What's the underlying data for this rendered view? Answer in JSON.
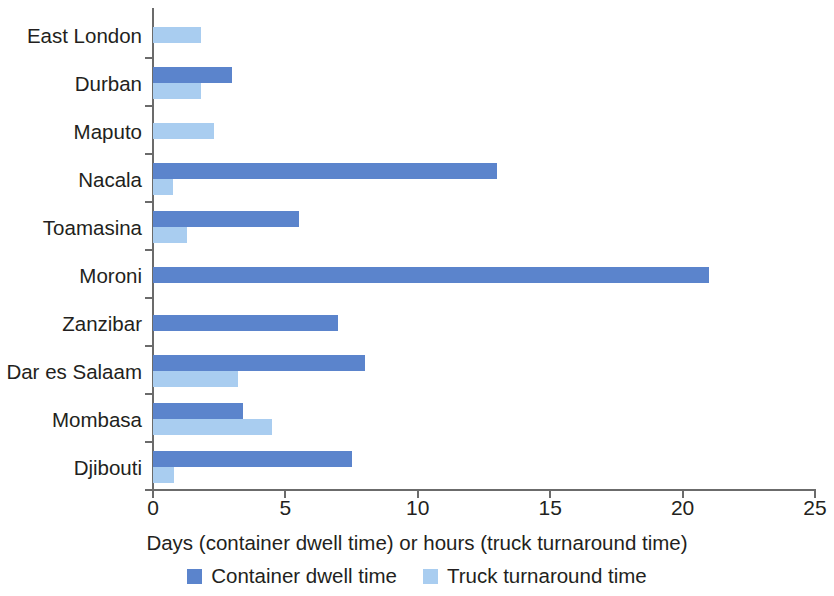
{
  "chart_data": {
    "type": "bar",
    "orientation": "horizontal",
    "title": "",
    "subtitle": "",
    "xlabel": "Days (container dwell time) or hours (truck turnaround time)",
    "ylabel": "",
    "xlim": [
      0,
      25
    ],
    "xticks": [
      0,
      5,
      10,
      15,
      20,
      25
    ],
    "xtick_labels": [
      "0",
      "5",
      "10",
      "15",
      "20",
      "25"
    ],
    "grid": false,
    "legend_position": "bottom-center",
    "categories": [
      "East London",
      "Durban",
      "Maputo",
      "Nacala",
      "Toamasina",
      "Moroni",
      "Zanzibar",
      "Dar es Salaam",
      "Mombasa",
      "Djibouti"
    ],
    "series": [
      {
        "name": "Container dwell time",
        "color": "#5b84cc",
        "unit": "days",
        "values": [
          null,
          3.0,
          null,
          13.0,
          5.5,
          21.0,
          7.0,
          8.0,
          3.4,
          7.5
        ]
      },
      {
        "name": "Truck turnaround time",
        "color": "#a9cdf0",
        "unit": "hours",
        "values": [
          1.8,
          1.8,
          2.3,
          0.75,
          1.3,
          null,
          null,
          3.2,
          4.5,
          0.8
        ]
      }
    ]
  },
  "legend": {
    "items": [
      {
        "label": "Container dwell time",
        "swatch": "dark"
      },
      {
        "label": "Truck turnaround time",
        "swatch": "light"
      }
    ]
  },
  "colors": {
    "container_dwell_time": "#5b84cc",
    "truck_turnaround_time": "#a9cdf0",
    "axis": "#6b6b6b",
    "text": "#231f20",
    "background": "#ffffff"
  }
}
